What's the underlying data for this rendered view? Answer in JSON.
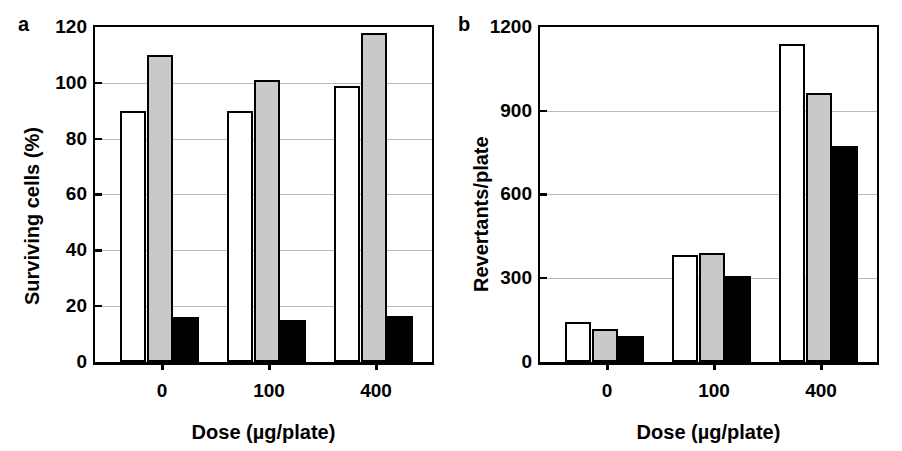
{
  "figure": {
    "background": "#ffffff",
    "width": 902,
    "height": 451
  },
  "panels": {
    "a": {
      "letter": "a",
      "ylabel": "Surviving cells (%)",
      "xlabel": "Dose (µg/plate)",
      "yticks": [
        "0",
        "20",
        "40",
        "60",
        "80",
        "100",
        "120"
      ],
      "xticks": [
        "0",
        "100",
        "400"
      ]
    },
    "b": {
      "letter": "b",
      "ylabel": "Revertants/plate",
      "xlabel": "Dose (µg/plate)",
      "yticks": [
        "0",
        "300",
        "600",
        "900",
        "1200"
      ],
      "xticks": [
        "0",
        "100",
        "400"
      ]
    }
  },
  "colors": {
    "series_white": "#ffffff",
    "series_gray": "#c9c9c9",
    "series_black": "#000000",
    "axis": "#000000",
    "gridline": "#b9b9b9"
  },
  "chart_data": [
    {
      "type": "bar",
      "panel": "a",
      "title": "a",
      "xlabel": "Dose (µg/plate)",
      "ylabel": "Surviving cells (%)",
      "categories": [
        "0",
        "100",
        "400"
      ],
      "ylim": [
        0,
        120
      ],
      "yticks": [
        0,
        20,
        40,
        60,
        80,
        100,
        120
      ],
      "grid": true,
      "legend": "none",
      "series": [
        {
          "name": "white",
          "fill": "#ffffff",
          "values": [
            90,
            90,
            99
          ]
        },
        {
          "name": "gray",
          "fill": "#c9c9c9",
          "values": [
            110,
            101,
            118
          ]
        },
        {
          "name": "black",
          "fill": "#000000",
          "values": [
            16,
            15,
            16.5
          ]
        }
      ]
    },
    {
      "type": "bar",
      "panel": "b",
      "title": "b",
      "xlabel": "Dose (µg/plate)",
      "ylabel": "Revertants/plate",
      "categories": [
        "0",
        "100",
        "400"
      ],
      "ylim": [
        0,
        1200
      ],
      "yticks": [
        0,
        300,
        600,
        900,
        1200
      ],
      "grid": true,
      "legend": "none",
      "series": [
        {
          "name": "white",
          "fill": "#ffffff",
          "values": [
            145,
            385,
            1140
          ]
        },
        {
          "name": "gray",
          "fill": "#c9c9c9",
          "values": [
            120,
            390,
            965
          ]
        },
        {
          "name": "black",
          "fill": "#000000",
          "values": [
            92,
            310,
            775
          ]
        }
      ]
    }
  ]
}
